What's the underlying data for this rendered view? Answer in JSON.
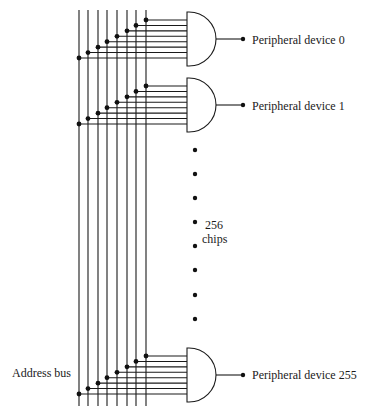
{
  "diagram": {
    "bus_label": "Address bus",
    "bus_line_count": 8,
    "bus_x": [
      79,
      88,
      98,
      107,
      117,
      127,
      136,
      146
    ],
    "chips": [
      {
        "id": "chip-0",
        "top": 12,
        "output_label": "Peripheral device 0"
      },
      {
        "id": "chip-1",
        "top": 78,
        "output_label": "Peripheral device 1"
      },
      {
        "id": "chip-255",
        "top": 348,
        "output_label": "Peripheral device 255"
      }
    ],
    "ellipsis_label_line1": "256",
    "ellipsis_label_line2": "chips",
    "ellipsis_dots_y": [
      150,
      174,
      198,
      222,
      246,
      270,
      295,
      319
    ],
    "colors": {
      "ink": "#1a1a1a",
      "background": "#ffffff"
    }
  }
}
